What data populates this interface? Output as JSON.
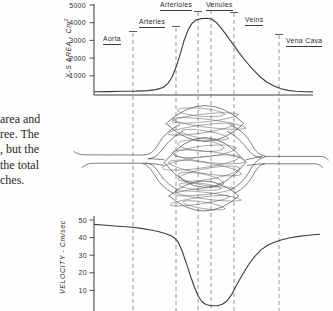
{
  "figure": {
    "caption_fragment": {
      "lines": [
        "area and",
        "ree. The",
        ", but the",
        "the total",
        "ches."
      ]
    },
    "region_labels": [
      {
        "label": "Aorta"
      },
      {
        "label": "Arteries"
      },
      {
        "label": "Arterioles"
      },
      {
        "label": "Venules"
      },
      {
        "label": "Veins"
      },
      {
        "label": "Vena Cava"
      }
    ],
    "line_color": "#3c3c3c",
    "dash_color": "#8d8d8d"
  },
  "chart_data": [
    {
      "type": "line",
      "title": "",
      "ylabel": "X-S AREA - Cm²",
      "ylabel_main": "X-S AREA - Cm",
      "ylabel_sup": "2",
      "xlabel": "",
      "x_regions": [
        "Aorta",
        "Arteries",
        "Arterioles",
        "Venules",
        "Veins",
        "Vena Cava"
      ],
      "yticks": [
        1000,
        2000,
        3000,
        4000,
        5000
      ],
      "ylim": [
        0,
        5200
      ],
      "grid": false,
      "points_format": "[x_position_px, area_cm2]",
      "points": [
        [
          94,
          100
        ],
        [
          108,
          110
        ],
        [
          122,
          122
        ],
        [
          136,
          138
        ],
        [
          148,
          165
        ],
        [
          156,
          220
        ],
        [
          163,
          340
        ],
        [
          168,
          570
        ],
        [
          172,
          920
        ],
        [
          176,
          1480
        ],
        [
          180,
          2180
        ],
        [
          184,
          2980
        ],
        [
          188,
          3580
        ],
        [
          192,
          3960
        ],
        [
          196,
          4150
        ],
        [
          201,
          4230
        ],
        [
          207,
          4250
        ],
        [
          212,
          4200
        ],
        [
          216,
          4030
        ],
        [
          221,
          3710
        ],
        [
          227,
          3260
        ],
        [
          233,
          2790
        ],
        [
          239,
          2310
        ],
        [
          246,
          1810
        ],
        [
          253,
          1350
        ],
        [
          260,
          950
        ],
        [
          267,
          640
        ],
        [
          274,
          420
        ],
        [
          281,
          265
        ],
        [
          288,
          175
        ],
        [
          296,
          125
        ],
        [
          305,
          100
        ],
        [
          313,
          90
        ]
      ]
    },
    {
      "type": "line",
      "title": "",
      "ylabel": "VELOCITY - Cm/sec",
      "xlabel": "",
      "yticks": [
        10,
        20,
        30,
        40,
        50
      ],
      "ylim": [
        0,
        52
      ],
      "grid": false,
      "points_format": "[x_position_px, velocity_cm_per_sec]",
      "points": [
        [
          94,
          47.5
        ],
        [
          106,
          47
        ],
        [
          118,
          46.5
        ],
        [
          130,
          46
        ],
        [
          141,
          45.2
        ],
        [
          151,
          44.3
        ],
        [
          159,
          43.3
        ],
        [
          166,
          42.2
        ],
        [
          171,
          41
        ],
        [
          175,
          39.6
        ],
        [
          178,
          37.6
        ],
        [
          182,
          32.5
        ],
        [
          186,
          26
        ],
        [
          190,
          19
        ],
        [
          194,
          12.5
        ],
        [
          198,
          7
        ],
        [
          202,
          3.5
        ],
        [
          206,
          2
        ],
        [
          211,
          1.3
        ],
        [
          217,
          1.3
        ],
        [
          222,
          2
        ],
        [
          227,
          4
        ],
        [
          232,
          8
        ],
        [
          237,
          13.5
        ],
        [
          243,
          19.5
        ],
        [
          249,
          25
        ],
        [
          255,
          29.5
        ],
        [
          261,
          33
        ],
        [
          268,
          35.8
        ],
        [
          275,
          37.5
        ],
        [
          282,
          38.8
        ],
        [
          290,
          39.9
        ],
        [
          299,
          40.7
        ],
        [
          308,
          41.3
        ],
        [
          320,
          41.9
        ]
      ]
    }
  ]
}
